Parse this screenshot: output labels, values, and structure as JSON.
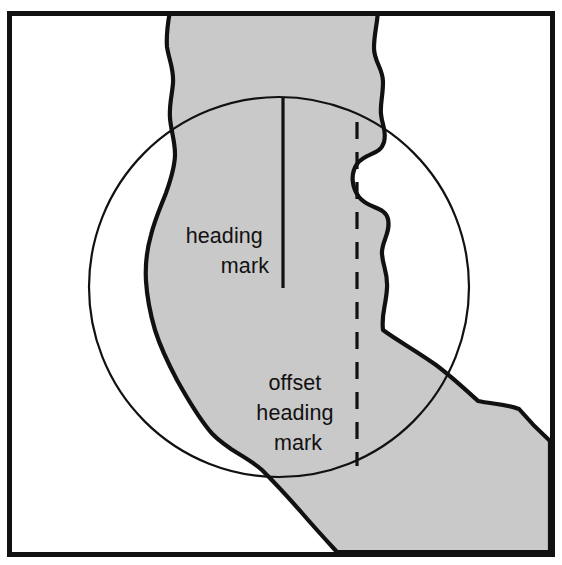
{
  "figure": {
    "kind": "technical-line-diagram",
    "canvas": {
      "width": 562,
      "height": 565
    },
    "colors": {
      "background": "#ffffff",
      "shaded_region_fill": "#c9c9c9",
      "outline": "#111111",
      "frame": "#111111",
      "circle_stroke": "#111111",
      "text": "#111111"
    },
    "frame": {
      "name": "figure-border",
      "x": 7,
      "y": 11,
      "width": 543,
      "height": 541,
      "stroke_width": 5
    },
    "circle": {
      "name": "radar-display-circle",
      "center_x": 279,
      "center_y": 287,
      "radius": 190,
      "stroke_width": 2.2
    },
    "shaded_region": {
      "name": "land-mass",
      "description": "irregular shaded channel running from top of frame, bending to the lower right"
    }
  },
  "labels": {
    "heading_mark": {
      "name": "heading-mark-label",
      "lines": [
        "heading",
        "mark"
      ],
      "anchor_x": 269,
      "anchor_y": 243,
      "line_height": 30,
      "text_anchor": "end"
    },
    "offset_heading_mark": {
      "name": "offset-heading-mark-label",
      "lines": [
        "offset",
        "heading",
        "mark"
      ],
      "anchor_x": 298,
      "anchor_y": 390,
      "line_height": 30,
      "text_anchor": "middle"
    }
  },
  "marks": {
    "heading_mark_line": {
      "name": "heading-mark-line",
      "x": 283,
      "y_top": 97,
      "y_bottom": 288,
      "stroke_width": 3.2,
      "style": "solid"
    },
    "offset_heading_mark_line": {
      "name": "offset-heading-mark-line",
      "x": 357,
      "y_top": 122,
      "y_bottom": 466,
      "stroke_width": 3.2,
      "style": "dashed",
      "dash_pattern": "17 13"
    }
  },
  "geometry": {
    "land_path": "M 170 11 L 378 11 C 377 26 374 34 374 48 C 374 62 383 68 383 82 C 383 96 380 104 381 114 C 382 126 387 130 384 142 C 380 156 366 152 357 164 C 350 174 352 188 359 197 C 368 209 385 206 388 219 C 391 233 381 242 382 254 C 383 268 388 272 387 288 C 386 306 381 314 383 330 C 398 341 418 352 436 365 C 452 377 466 390 478 401 C 492 404 506 404 519 409 C 530 422 540 432 550 441 L 550 552 L 337 552 C 326 540 314 527 302 513 C 288 497 274 482 262 470 C 252 461 240 455 231 449 C 221 442 214 437 209 430 C 197 415 187 398 177 380 C 168 363 160 346 155 330 C 150 313 147 297 146 281 C 145 264 147 249 151 235 C 155 219 161 206 166 193 C 171 179 175 167 175 154 C 175 141 171 131 170 118 C 169 105 172 96 173 83 C 174 69 169 60 167 47 C 166 34 168 22 170 11 Z"
  }
}
